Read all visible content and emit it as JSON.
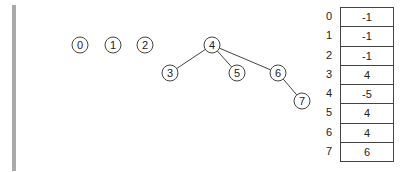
{
  "diagram": {
    "type": "disjoint-set-forest",
    "nodes": [
      {
        "id": "0",
        "label": "0",
        "x": 80,
        "y": 45
      },
      {
        "id": "1",
        "label": "1",
        "x": 113,
        "y": 45
      },
      {
        "id": "2",
        "label": "2",
        "x": 145,
        "y": 45
      },
      {
        "id": "3",
        "label": "3",
        "x": 170,
        "y": 73
      },
      {
        "id": "4",
        "label": "4",
        "x": 212,
        "y": 45
      },
      {
        "id": "5",
        "label": "5",
        "x": 237,
        "y": 73
      },
      {
        "id": "6",
        "label": "6",
        "x": 278,
        "y": 73
      },
      {
        "id": "7",
        "label": "7",
        "x": 302,
        "y": 101
      }
    ],
    "edges": [
      {
        "from": "4",
        "to": "3"
      },
      {
        "from": "4",
        "to": "5"
      },
      {
        "from": "4",
        "to": "6"
      },
      {
        "from": "6",
        "to": "7"
      }
    ]
  },
  "parent_array": {
    "rows": [
      {
        "index": "0",
        "value": "-1"
      },
      {
        "index": "1",
        "value": "-1"
      },
      {
        "index": "2",
        "value": "-1"
      },
      {
        "index": "3",
        "value": "4"
      },
      {
        "index": "4",
        "value": "-5"
      },
      {
        "index": "5",
        "value": "4"
      },
      {
        "index": "6",
        "value": "4"
      },
      {
        "index": "7",
        "value": "6"
      }
    ]
  },
  "colors": {
    "left_bar": "#a9a9a9",
    "stroke": "#444444",
    "text": "#222222"
  }
}
